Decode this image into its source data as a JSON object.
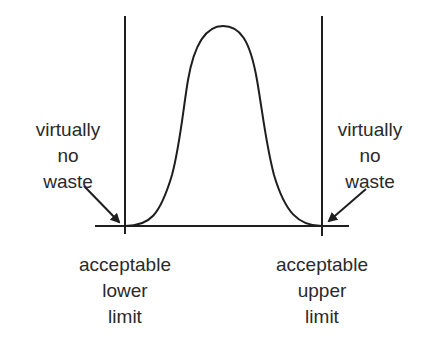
{
  "diagram": {
    "type": "normal-distribution-within-tolerance-limits",
    "curve": {
      "shape": "bell",
      "peak": {
        "x": 223,
        "y": 26
      },
      "base_y": 226,
      "left_foot_x": 125,
      "right_foot_x": 322
    },
    "limits": {
      "lower": {
        "x": 125,
        "label_lines": [
          "acceptable",
          "lower",
          "limit"
        ]
      },
      "upper": {
        "x": 322,
        "label_lines": [
          "acceptable",
          "upper",
          "limit"
        ]
      }
    },
    "annotations": {
      "left": {
        "label_lines": [
          "virtually",
          "no",
          "waste"
        ],
        "arrow": {
          "from": [
            84,
            186
          ],
          "to": [
            121,
            224
          ]
        }
      },
      "right": {
        "label_lines": [
          "virtually",
          "no",
          "waste"
        ],
        "arrow": {
          "from": [
            366,
            189
          ],
          "to": [
            327,
            223
          ]
        }
      }
    },
    "colors": {
      "line": "#1e1e1e",
      "text": "#2a2a2a",
      "background": "#ffffff"
    }
  }
}
